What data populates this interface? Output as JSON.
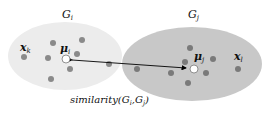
{
  "diagram": {
    "clusters": [
      {
        "id": "Gi",
        "label_main": "G",
        "label_sub": "i",
        "fill": "#ececec",
        "point_label_main": "x",
        "point_label_sub": "k",
        "centroid_label_main": "μ",
        "centroid_label_sub": "i"
      },
      {
        "id": "Gj",
        "label_main": "G",
        "label_sub": "j",
        "fill": "#c8c8c8",
        "point_label_main": "x",
        "point_label_sub": "l",
        "centroid_label_main": "μ",
        "centroid_label_sub": "j"
      }
    ],
    "caption": {
      "func": "similarity(",
      "g1": "G",
      "g1_sub": "i",
      "comma": ",",
      "g2": "G",
      "g2_sub": "j",
      "close": ")"
    },
    "colors": {
      "dot": "#8a8a8a",
      "arrow": "#000000",
      "centroid_fill": "#ffffff"
    }
  }
}
